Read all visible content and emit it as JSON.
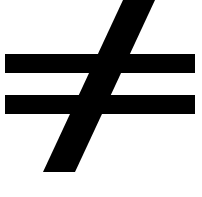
{
  "image": {
    "kind": "math-symbol-glyph",
    "symbol_name": "not-equal-sign",
    "symbol_character": "≠",
    "alt_text": "Not equal to sign",
    "width": 202,
    "height": 197,
    "background_color": "#ffffff",
    "foreground_color": "#000000"
  },
  "shapes": {
    "bar_top": {
      "name": "upper-horizontal-bar",
      "x": 5,
      "y": 54,
      "width": 190,
      "height": 19,
      "color": "#000000"
    },
    "bar_bottom": {
      "name": "lower-horizontal-bar",
      "x": 5,
      "y": 95,
      "width": 190,
      "height": 19,
      "color": "#000000"
    },
    "slash": {
      "name": "diagonal-stroke",
      "points": "123,0 155,0 75,172 43,172",
      "color": "#000000",
      "top_x_left": 123,
      "top_x_right": 155,
      "bottom_x_left": 43,
      "bottom_x_right": 75,
      "top_y": 0,
      "bottom_y": 172,
      "thickness": 32
    }
  }
}
